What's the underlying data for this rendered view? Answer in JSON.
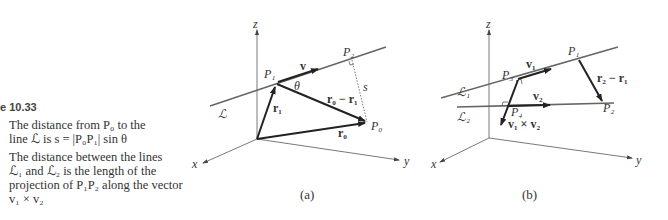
{
  "caption": {
    "figure_number": "e 10.33",
    "item_a": "The distance from P₀ to the line ℒ is s = |P₀P₁| sin θ",
    "item_a_line1": "The distance from P₀ to the",
    "item_a_line2": "line ℒ is s = |P₀P₁| sin θ",
    "item_b_line1": "The distance between the lines",
    "item_b_line2": "ℒ₁ and ℒ₂ is the length of the",
    "item_b_line3": "projection of P₁P₂ along the vector",
    "item_b_line4": "v₁ × v₂"
  },
  "figure_a": {
    "sublabel": "(a)",
    "axes": {
      "x": "x",
      "y": "y",
      "z": "z"
    },
    "line_label": "ℒ",
    "points": {
      "P0": "P₀",
      "P1": "P₁",
      "P2": "P₂"
    },
    "vectors": {
      "v": "v",
      "r1": "r₁",
      "r0": "r₀",
      "r0_minus_r1": "r₀ − r₁"
    },
    "angle": "θ",
    "distance": "s"
  },
  "figure_b": {
    "sublabel": "(b)",
    "axes": {
      "x": "x",
      "y": "y",
      "z": "z"
    },
    "line_labels": {
      "L1": "ℒ₁",
      "L2": "ℒ₂"
    },
    "points": {
      "P1": "P₁",
      "P2": "P₂",
      "P3": "P₃",
      "P4": "P₄"
    },
    "vectors": {
      "v1": "v₁",
      "v2": "v₂",
      "r2_minus_r1": "r₂ − r₁",
      "v1_cross_v2": "v₁ × v₂"
    }
  }
}
